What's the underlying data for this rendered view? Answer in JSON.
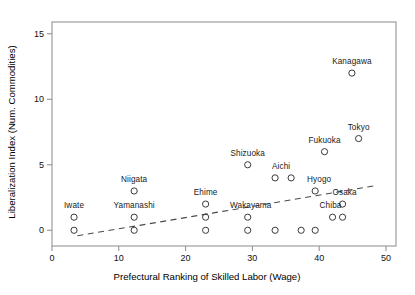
{
  "chart_data": {
    "type": "scatter",
    "title": "",
    "xlabel": "Prefectural Ranking of Skilled Labor (Wage)",
    "ylabel": "Liberalization Index (Num. Commodities)",
    "xlim": [
      0,
      51.5
    ],
    "ylim": [
      -1.2,
      15.9
    ],
    "xticks": [
      0,
      10,
      20,
      30,
      40,
      50
    ],
    "xtick_labels": [
      "0",
      "10",
      "20",
      "30",
      "40",
      "50"
    ],
    "yticks": [
      0,
      5,
      10,
      15
    ],
    "ytick_labels": [
      "0",
      "5",
      "10",
      "15"
    ],
    "grid": false,
    "legend": null,
    "marker": "open-circle",
    "points": [
      {
        "x": 3.3,
        "y": 1,
        "label": "Iwate",
        "label_dx": 0,
        "label_dy": -7
      },
      {
        "x": 3.3,
        "y": 0,
        "label": "",
        "label_dx": 0,
        "label_dy": 0
      },
      {
        "x": 12.3,
        "y": 3,
        "label": "Niigata",
        "label_dx": 0,
        "label_dy": -7
      },
      {
        "x": 12.3,
        "y": 1,
        "label": "Yamanashi",
        "label_dx": 0,
        "label_dy": -7
      },
      {
        "x": 12.3,
        "y": 0,
        "label": "",
        "label_dx": 0,
        "label_dy": 0
      },
      {
        "x": 23.0,
        "y": 2,
        "label": "Ehime",
        "label_dx": 0,
        "label_dy": -7
      },
      {
        "x": 23.0,
        "y": 1,
        "label": "",
        "label_dx": 0,
        "label_dy": 0
      },
      {
        "x": 23.0,
        "y": 0,
        "label": "",
        "label_dx": 0,
        "label_dy": 0
      },
      {
        "x": 29.3,
        "y": 5,
        "label": "Shizuoka",
        "label_dx": 0,
        "label_dy": -7
      },
      {
        "x": 29.3,
        "y": 1,
        "label": "Wakayama",
        "label_dx": 3,
        "label_dy": -7
      },
      {
        "x": 29.3,
        "y": 0,
        "label": "",
        "label_dx": 0,
        "label_dy": 0
      },
      {
        "x": 33.4,
        "y": 4,
        "label": "Aichi",
        "label_dx": 6,
        "label_dy": -7
      },
      {
        "x": 33.4,
        "y": 0,
        "label": "",
        "label_dx": 0,
        "label_dy": 0
      },
      {
        "x": 35.8,
        "y": 4,
        "label": "",
        "label_dx": 0,
        "label_dy": 0
      },
      {
        "x": 37.3,
        "y": 0,
        "label": "",
        "label_dx": 0,
        "label_dy": 0
      },
      {
        "x": 39.4,
        "y": 3,
        "label": "Hyogo",
        "label_dx": 4,
        "label_dy": -7
      },
      {
        "x": 39.4,
        "y": 0,
        "label": "",
        "label_dx": 0,
        "label_dy": 0
      },
      {
        "x": 40.8,
        "y": 6,
        "label": "Fukuoka",
        "label_dx": 0,
        "label_dy": -7
      },
      {
        "x": 42.0,
        "y": 1,
        "label": "Chiba",
        "label_dx": -2,
        "label_dy": -7
      },
      {
        "x": 43.5,
        "y": 2,
        "label": "Osaka",
        "label_dx": 2,
        "label_dy": -7
      },
      {
        "x": 43.5,
        "y": 1,
        "label": "",
        "label_dx": 0,
        "label_dy": 0
      },
      {
        "x": 44.9,
        "y": 12,
        "label": "Kanagawa",
        "label_dx": 0,
        "label_dy": -7
      },
      {
        "x": 45.9,
        "y": 7,
        "label": "Tokyo",
        "label_dx": 0,
        "label_dy": -7
      }
    ],
    "trend_line": {
      "style": "dashed",
      "x_start": 3.8,
      "y_start": -0.42,
      "x_end": 48.6,
      "y_end": 3.42
    }
  },
  "style": {
    "frame_color": "#8a8a8a",
    "marker_edge_color": "#3a3a3a",
    "trend_color": "#4a4a4a",
    "text_color": "#111111",
    "background": "#ffffff"
  }
}
